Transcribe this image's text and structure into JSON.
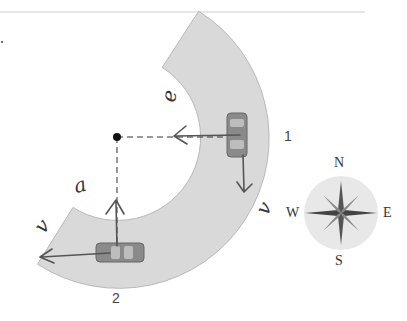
{
  "diagram": {
    "type": "car-on-curved-road",
    "center_point": {
      "x": 117,
      "y": 137
    },
    "road": {
      "inner_radius": 83,
      "outer_radius": 150,
      "start_angle_deg": -57,
      "end_angle_deg": 122,
      "color": "#d9d9d9",
      "edge_color": "#b0b0b0"
    },
    "positions": [
      {
        "label": "1",
        "x": 236,
        "y": 108
      },
      {
        "label": "2",
        "x": 117,
        "y": 252
      }
    ],
    "handwritten_vectors": [
      {
        "label": "e⃗",
        "text": "e",
        "at_position": "1",
        "direction": "toward-center"
      },
      {
        "label": "v⃗",
        "text": "v",
        "at_position": "1",
        "direction": "south"
      },
      {
        "label": "a⃗",
        "text": "a",
        "at_position": "2",
        "direction": "north"
      },
      {
        "label": "v⃗",
        "text": "v",
        "at_position": "2",
        "direction": "west"
      }
    ],
    "compass": {
      "labels": {
        "north": "N",
        "south": "S",
        "east": "E",
        "west": "W"
      },
      "color": "#e6e6e6"
    },
    "ink_color": "#555555"
  }
}
